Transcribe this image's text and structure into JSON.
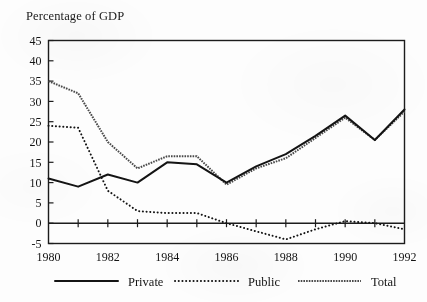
{
  "figure": {
    "axis_title": "Percentage of GDP",
    "background_color": "#fdfdfd",
    "ink_color": "#1a1a1a"
  },
  "chart_data": {
    "type": "line",
    "title": "Percentage of GDP",
    "xlabel": "",
    "ylabel": "Percentage of GDP",
    "x": [
      1980,
      1981,
      1982,
      1983,
      1984,
      1985,
      1986,
      1987,
      1988,
      1989,
      1990,
      1991,
      1992
    ],
    "xlim": [
      1980,
      1992
    ],
    "ylim": [
      -5,
      45
    ],
    "yticks": [
      -5,
      0,
      5,
      10,
      15,
      20,
      25,
      30,
      35,
      40,
      45
    ],
    "ytick_labels": [
      "-5",
      "0",
      "5",
      "10",
      "15",
      "20",
      "25",
      "30",
      "35",
      "40",
      "45"
    ],
    "xticks": [
      1980,
      1981,
      1982,
      1983,
      1984,
      1985,
      1986,
      1987,
      1988,
      1989,
      1990,
      1991,
      1992
    ],
    "xtick_labels": [
      "1980",
      "",
      "1982",
      "",
      "1984",
      "",
      "1986",
      "",
      "1988",
      "",
      "1990",
      "",
      "1992"
    ],
    "grid": false,
    "legend_position": "below",
    "zero_line": 0,
    "series": [
      {
        "name": "Private",
        "style": "solid",
        "color": "#141414",
        "values": [
          11,
          9,
          12,
          10,
          15,
          14.5,
          10,
          14,
          17,
          21.5,
          26.5,
          20.5,
          28
        ]
      },
      {
        "name": "Public",
        "style": "dotted",
        "color": "#141414",
        "values": [
          24,
          23.5,
          8,
          3,
          2.5,
          2.5,
          0,
          -2,
          -4,
          -1.5,
          0.5,
          0,
          -1.5
        ]
      },
      {
        "name": "Total",
        "style": "hatched",
        "color": "#4a4a4a",
        "values": [
          35,
          32,
          20,
          13.5,
          16.5,
          16.5,
          9.5,
          13.5,
          16,
          21,
          26,
          20.5,
          27.5
        ]
      }
    ]
  },
  "legend": {
    "items": [
      {
        "label": "Private",
        "style": "solid"
      },
      {
        "label": "Public",
        "style": "dotted"
      },
      {
        "label": "Total",
        "style": "hatched"
      }
    ]
  }
}
